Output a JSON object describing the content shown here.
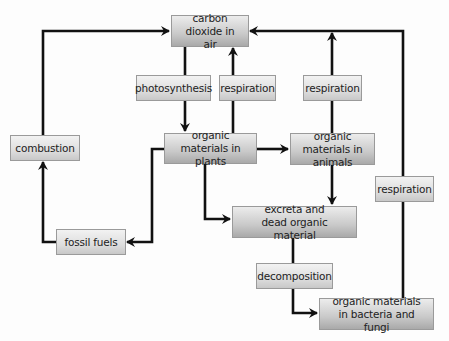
{
  "diagram": {
    "nodes": {
      "co2": "carbon dioxide in air",
      "photosynthesis": "photosynthesis",
      "respiration_plants": "respiration",
      "respiration_animals": "respiration",
      "combustion": "combustion",
      "plants": "organic materials in plants",
      "animals": "organic materials in animals",
      "respiration_decomposers": "respiration",
      "excreta": "excreta and dead organic material",
      "fossil_fuels": "fossil fuels",
      "decomposition": "decomposition",
      "bacteria": "organic materials in bacteria and fungi"
    },
    "edges": [
      {
        "from": "carbon dioxide in air",
        "to": "organic materials in plants",
        "label": "photosynthesis"
      },
      {
        "from": "organic materials in plants",
        "to": "carbon dioxide in air",
        "label": "respiration"
      },
      {
        "from": "organic materials in animals",
        "to": "carbon dioxide in air",
        "label": "respiration"
      },
      {
        "from": "organic materials in bacteria and fungi",
        "to": "carbon dioxide in air",
        "label": "respiration"
      },
      {
        "from": "organic materials in plants",
        "to": "organic materials in animals",
        "label": ""
      },
      {
        "from": "organic materials in plants",
        "to": "fossil fuels",
        "label": ""
      },
      {
        "from": "organic materials in plants",
        "to": "excreta and dead organic material",
        "label": ""
      },
      {
        "from": "organic materials in animals",
        "to": "excreta and dead organic material",
        "label": ""
      },
      {
        "from": "fossil fuels",
        "to": "carbon dioxide in air",
        "label": "combustion"
      },
      {
        "from": "excreta and dead organic material",
        "to": "organic materials in bacteria and fungi",
        "label": "decomposition"
      }
    ],
    "colors": {
      "line": "#111111",
      "box_border": "#9a9a9a",
      "box_top": "#ececec",
      "box_bottom": "#a9a9a9"
    }
  }
}
